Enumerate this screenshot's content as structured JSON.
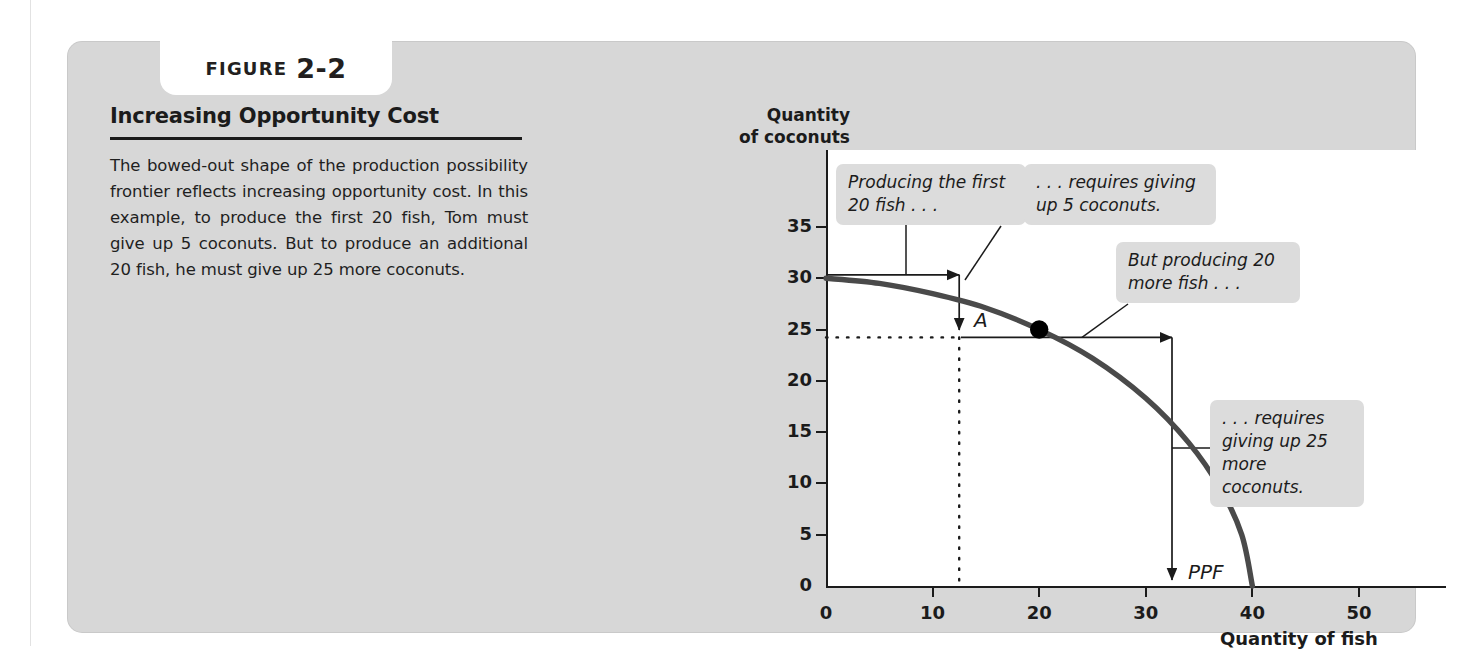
{
  "figure": {
    "tab_word": "FIGURE",
    "tab_number": "2-2",
    "title": "Increasing Opportunity Cost",
    "description": "The bowed-out shape of the production possibility frontier reflects increasing opportunity cost. In this example, to produce the first 20 fish, Tom must give up 5 coconuts. But to produce an additional 20 fish, he must give up 25 more coconuts."
  },
  "chart_data": {
    "type": "line",
    "title": "Increasing Opportunity Cost",
    "xlabel": "Quantity of fish",
    "ylabel": "Quantity\nof coconuts",
    "ylabel_line1": "Quantity",
    "ylabel_line2": "of coconuts",
    "xlim": [
      0,
      50
    ],
    "ylim": [
      0,
      37
    ],
    "xticks": [
      0,
      10,
      20,
      30,
      40,
      50
    ],
    "yticks": [
      0,
      5,
      10,
      15,
      20,
      25,
      30,
      35
    ],
    "grid": false,
    "legend": "none",
    "series": [
      {
        "name": "PPF",
        "label": "PPF",
        "points": [
          {
            "x": 0,
            "y": 30
          },
          {
            "x": 5,
            "y": 29.5
          },
          {
            "x": 10,
            "y": 28.5
          },
          {
            "x": 15,
            "y": 27.1
          },
          {
            "x": 20,
            "y": 25
          },
          {
            "x": 25,
            "y": 22.2
          },
          {
            "x": 30,
            "y": 18.3
          },
          {
            "x": 34,
            "y": 14
          },
          {
            "x": 37,
            "y": 9.5
          },
          {
            "x": 39,
            "y": 5
          },
          {
            "x": 40,
            "y": 0
          }
        ],
        "color": "#4a4a4a"
      }
    ],
    "points": [
      {
        "label": "A",
        "x": 20,
        "y": 25,
        "color": "#000000"
      }
    ],
    "annotations": [
      {
        "id": "a1",
        "text": "Producing the first\n20 fish . . ."
      },
      {
        "id": "a2",
        "text": ". . . requires giving\nup 5 coconuts."
      },
      {
        "id": "a3",
        "text": "But producing 20\nmore fish . . ."
      },
      {
        "id": "a4",
        "text": ". . . requires\ngiving up 25\nmore coconuts."
      }
    ]
  },
  "colors": {
    "panel": "#d7d7d7",
    "callout": "#dcdcdc",
    "curve": "#4a4a4a",
    "ink": "#1b1b1b",
    "plot_bg": "#ffffff"
  }
}
